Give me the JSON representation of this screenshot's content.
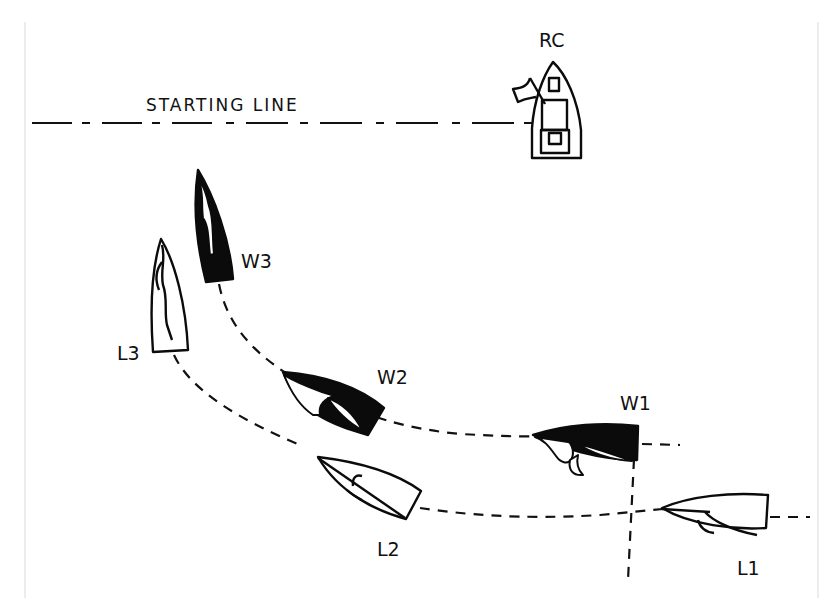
{
  "diagram": {
    "starting_line_label": "STARTING LINE",
    "committee_boat_label": "RC",
    "boats": [
      {
        "id": "W3",
        "label": "W3",
        "role": "windward",
        "hull_color": "#0b0b0b"
      },
      {
        "id": "L3",
        "label": "L3",
        "role": "leeward",
        "hull_color": "#ffffff"
      },
      {
        "id": "W2",
        "label": "W2",
        "role": "windward",
        "hull_color": "#0b0b0b"
      },
      {
        "id": "L2",
        "label": "L2",
        "role": "leeward",
        "hull_color": "#ffffff"
      },
      {
        "id": "W1",
        "label": "W1",
        "role": "windward",
        "hull_color": "#0b0b0b"
      },
      {
        "id": "L1",
        "label": "L1",
        "role": "leeward",
        "hull_color": "#ffffff"
      }
    ],
    "tracks": [
      {
        "name": "windward-track",
        "through": [
          "W3",
          "W2",
          "W1"
        ]
      },
      {
        "name": "leeward-track",
        "through": [
          "L3",
          "L2",
          "L1"
        ]
      }
    ],
    "colors": {
      "ink": "#0b0b0b",
      "background": "#ffffff",
      "frame": "#d9d9d9"
    }
  }
}
